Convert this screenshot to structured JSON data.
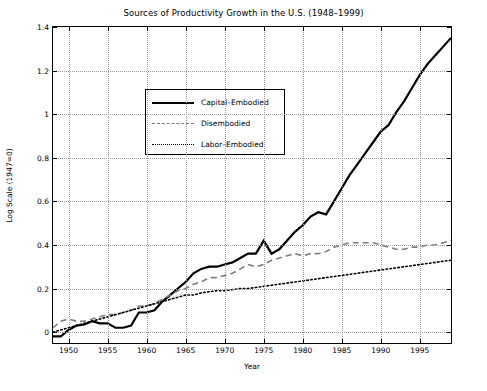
{
  "chart_data": {
    "type": "line",
    "title": "Sources of Productivity Growth in the U.S. (1948–1999)",
    "xlabel": "Year",
    "ylabel": "Log Scale (1947=0)",
    "xlim": [
      1948,
      1999
    ],
    "ylim": [
      -0.05,
      1.4
    ],
    "grid": true,
    "legend_position": "upper-left-inside",
    "xticks": [
      "1950",
      "1955",
      "1960",
      "1965",
      "1970",
      "1975",
      "1980",
      "1985",
      "1990",
      "1995"
    ],
    "xtick_values": [
      1950,
      1955,
      1960,
      1965,
      1970,
      1975,
      1980,
      1985,
      1990,
      1995
    ],
    "yticks": [
      "0",
      "0.2",
      "0.4",
      "0.6",
      "0.8",
      "1",
      "1.2",
      "1.4"
    ],
    "ytick_values": [
      0,
      0.2,
      0.4,
      0.6,
      0.8,
      1.0,
      1.2,
      1.4
    ],
    "x": [
      1948,
      1949,
      1950,
      1951,
      1952,
      1953,
      1954,
      1955,
      1956,
      1957,
      1958,
      1959,
      1960,
      1961,
      1962,
      1963,
      1964,
      1965,
      1966,
      1967,
      1968,
      1969,
      1970,
      1971,
      1972,
      1973,
      1974,
      1975,
      1976,
      1977,
      1978,
      1979,
      1980,
      1981,
      1982,
      1983,
      1984,
      1985,
      1986,
      1987,
      1988,
      1989,
      1990,
      1991,
      1992,
      1993,
      1994,
      1995,
      1996,
      1997,
      1998,
      1999
    ],
    "series": [
      {
        "name": "Capital–Embodied",
        "style": "solid",
        "color": "#000000",
        "values": [
          -0.02,
          -0.02,
          0.01,
          0.03,
          0.035,
          0.05,
          0.04,
          0.04,
          0.02,
          0.02,
          0.03,
          0.09,
          0.09,
          0.1,
          0.14,
          0.17,
          0.2,
          0.23,
          0.27,
          0.29,
          0.3,
          0.3,
          0.31,
          0.32,
          0.34,
          0.36,
          0.36,
          0.42,
          0.36,
          0.38,
          0.42,
          0.46,
          0.49,
          0.53,
          0.55,
          0.54,
          0.6,
          0.66,
          0.72,
          0.77,
          0.82,
          0.87,
          0.92,
          0.95,
          1.01,
          1.06,
          1.12,
          1.18,
          1.23,
          1.27,
          1.31,
          1.35
        ]
      },
      {
        "name": "Disembodied",
        "style": "dashed",
        "color": "#7d7d7d",
        "values": [
          0.02,
          0.05,
          0.06,
          0.05,
          0.05,
          0.06,
          0.07,
          0.08,
          0.08,
          0.09,
          0.1,
          0.12,
          0.12,
          0.13,
          0.15,
          0.17,
          0.19,
          0.2,
          0.22,
          0.23,
          0.25,
          0.25,
          0.26,
          0.27,
          0.29,
          0.31,
          0.3,
          0.31,
          0.33,
          0.34,
          0.35,
          0.36,
          0.35,
          0.36,
          0.36,
          0.37,
          0.39,
          0.4,
          0.41,
          0.41,
          0.41,
          0.41,
          0.4,
          0.39,
          0.38,
          0.38,
          0.39,
          0.39,
          0.4,
          0.4,
          0.41,
          0.42
        ]
      },
      {
        "name": "Labor–Embodied",
        "style": "dotted",
        "color": "#000000",
        "values": [
          0.0,
          0.01,
          0.02,
          0.03,
          0.04,
          0.05,
          0.06,
          0.07,
          0.08,
          0.09,
          0.1,
          0.11,
          0.12,
          0.13,
          0.14,
          0.15,
          0.16,
          0.17,
          0.17,
          0.18,
          0.185,
          0.19,
          0.19,
          0.195,
          0.2,
          0.2,
          0.205,
          0.21,
          0.215,
          0.22,
          0.225,
          0.23,
          0.235,
          0.24,
          0.245,
          0.25,
          0.255,
          0.26,
          0.265,
          0.27,
          0.275,
          0.28,
          0.285,
          0.29,
          0.295,
          0.3,
          0.305,
          0.31,
          0.315,
          0.32,
          0.325,
          0.33
        ]
      }
    ]
  }
}
